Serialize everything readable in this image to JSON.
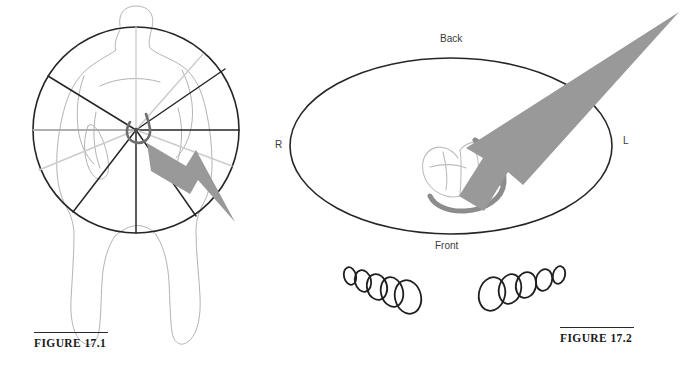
{
  "page": {
    "background_color": "#ffffff",
    "width": 696,
    "height": 368
  },
  "colors": {
    "arrow_gray": "#999999",
    "ink_black": "#262626",
    "body_outline_gray": "#b3b3b3",
    "spoke_light_gray": "#c8c8c8",
    "catheter_gray": "#8c8c8c",
    "label_gray": "#3a3a3a"
  },
  "figures": [
    {
      "id": "figure-17-1",
      "caption": "FIGURE 17.1",
      "description": "Anterior view of a torso with a circular dial divided into pie-shaped sectors over the chest, a small horseshoe-shaped catheter loop at the hub, and a gray arrow pointing down and to the right.",
      "labels": [],
      "arrow": {
        "direction": "down-right",
        "angle_degrees": 35,
        "color": "#999999"
      },
      "dial": {
        "center_x": 136,
        "center_y": 130,
        "radius": 103,
        "sector_count": 7
      }
    },
    {
      "id": "figure-17-2",
      "caption": "FIGURE 17.2",
      "description": "Transverse (axial) view: large ellipse representing the chest cross-section with a heart and gray catheter loop inside, a gray arrow exiting toward the upper left-posterior, and two descending chains of five ellipses below.",
      "labels": [
        {
          "name": "back",
          "text": "Back",
          "position": "top"
        },
        {
          "name": "front",
          "text": "Front",
          "position": "bottom"
        },
        {
          "name": "r",
          "text": "R",
          "position": "left"
        },
        {
          "name": "l",
          "text": "L",
          "position": "right"
        }
      ],
      "arrow": {
        "direction": "up-right",
        "angle_degrees": 35,
        "color": "#999999"
      },
      "ellipse_chains": [
        {
          "name": "left-chain",
          "count": 5,
          "order": "increasing-size-left-to-right",
          "slope": "descending"
        },
        {
          "name": "right-chain",
          "count": 5,
          "order": "decreasing-size-left-to-right",
          "slope": "ascending"
        }
      ]
    }
  ]
}
